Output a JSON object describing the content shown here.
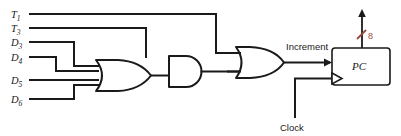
{
  "diagram": {
    "type": "logic-circuit-schematic",
    "background_color": "#ffffff",
    "line_color": "#1a1a1a",
    "accent_color": "#9c4a3c",
    "inputs": [
      {
        "id": "t1",
        "base": "T",
        "subscript": "1",
        "label": "T1",
        "destination": "or-gate-output"
      },
      {
        "id": "t3",
        "base": "T",
        "subscript": "3",
        "label": "T3",
        "destination": "and-gate"
      },
      {
        "id": "d3",
        "base": "D",
        "subscript": "3",
        "label": "D3",
        "destination": "or-gate-input"
      },
      {
        "id": "d4",
        "base": "D",
        "subscript": "4",
        "label": "D4",
        "destination": "or-gate-input"
      },
      {
        "id": "d5",
        "base": "D",
        "subscript": "5",
        "label": "D5",
        "destination": "or-gate-input"
      },
      {
        "id": "d6",
        "base": "D",
        "subscript": "6",
        "label": "D6",
        "destination": "or-gate-input"
      }
    ],
    "gates": [
      {
        "id": "or-input",
        "kind": "OR",
        "inputs": 4,
        "input_signals": [
          "D3",
          "D4",
          "D5",
          "D6"
        ]
      },
      {
        "id": "and",
        "kind": "AND",
        "inputs": 2,
        "input_signals": [
          "T3",
          "or-input-output"
        ]
      },
      {
        "id": "or-output",
        "kind": "OR",
        "inputs": 2,
        "input_signals": [
          "T1",
          "and-output"
        ]
      }
    ],
    "wire_labels": {
      "increment": "Increment",
      "clock": "Clock"
    },
    "register": {
      "label": "PC",
      "name": "program-counter-register",
      "clock_input": "Clock",
      "enable_input": "Increment"
    },
    "bus": {
      "width_label": "8",
      "direction": "output-up",
      "color": "#9c4a3c"
    }
  }
}
